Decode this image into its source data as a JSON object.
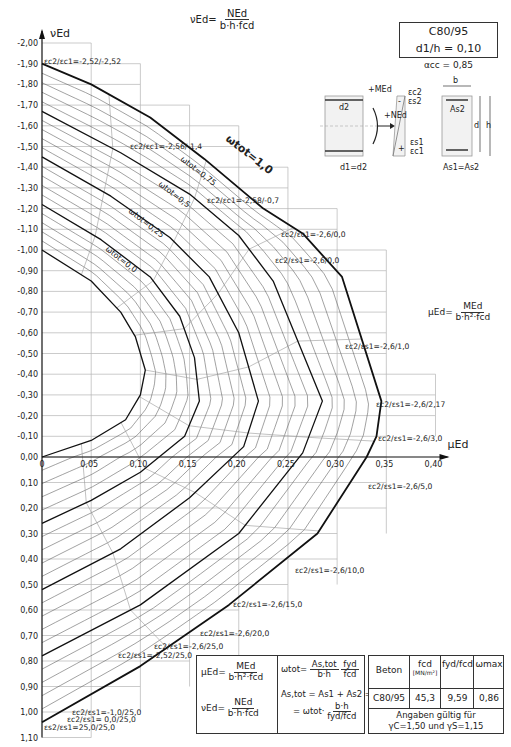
{
  "chart_data": {
    "type": "line",
    "concrete_class": "C80/95",
    "d1_over_h": "d1/h = 0,10",
    "alpha_cc": "αcc = 0,85",
    "xlabel": "μEd",
    "ylabel": "νEd",
    "x_ticks": [
      "0",
      "0,05",
      "0,10",
      "0,15",
      "0,20",
      "0,25",
      "0,30",
      "0,35",
      "0,40"
    ],
    "x_tick_values": [
      0,
      0.05,
      0.1,
      0.15,
      0.2,
      0.25,
      0.3,
      0.35,
      0.4
    ],
    "y_ticks": [
      "-2,00",
      "-1,90",
      "-1,80",
      "-1,70",
      "-1,60",
      "-1,50",
      "-1,40",
      "-1,30",
      "-1,20",
      "-1,10",
      "-1,00",
      "-0,90",
      "-0,80",
      "-0,70",
      "-0,60",
      "-0,50",
      "-0,40",
      "-0,30",
      "-0,20",
      "-0,10",
      "0,00",
      "0,10",
      "0,20",
      "0,30",
      "0,40",
      "0,50",
      "0,60",
      "0,70",
      "0,80",
      "0,90",
      "1,00",
      "1,10"
    ],
    "xlim": [
      0,
      0.4
    ],
    "ylim": [
      -2.0,
      1.1
    ],
    "grid": true,
    "series": [
      {
        "name": "ωtot=0,0",
        "points": [
          [
            0,
            -1.0
          ],
          [
            0.05,
            -0.85
          ],
          [
            0.08,
            -0.7
          ],
          [
            0.095,
            -0.58
          ],
          [
            0.105,
            -0.42
          ],
          [
            0.1,
            -0.3
          ],
          [
            0.085,
            -0.18
          ],
          [
            0.05,
            -0.08
          ],
          [
            0,
            0.0
          ]
        ]
      },
      {
        "name": "ωtot=0,25",
        "points": [
          [
            0,
            -1.22
          ],
          [
            0.06,
            -1.05
          ],
          [
            0.11,
            -0.87
          ],
          [
            0.14,
            -0.68
          ],
          [
            0.155,
            -0.48
          ],
          [
            0.16,
            -0.27
          ],
          [
            0.145,
            -0.1
          ],
          [
            0.1,
            0.06
          ],
          [
            0.05,
            0.17
          ],
          [
            0,
            0.26
          ]
        ]
      },
      {
        "name": "ωtot=0,5",
        "points": [
          [
            0,
            -1.45
          ],
          [
            0.07,
            -1.26
          ],
          [
            0.13,
            -1.06
          ],
          [
            0.17,
            -0.87
          ],
          [
            0.2,
            -0.6
          ],
          [
            0.22,
            -0.27
          ],
          [
            0.205,
            -0.05
          ],
          [
            0.15,
            0.16
          ],
          [
            0.08,
            0.36
          ],
          [
            0,
            0.52
          ]
        ]
      },
      {
        "name": "ωtot=0,75",
        "points": [
          [
            0,
            -1.67
          ],
          [
            0.08,
            -1.47
          ],
          [
            0.15,
            -1.27
          ],
          [
            0.2,
            -1.07
          ],
          [
            0.235,
            -0.85
          ],
          [
            0.285,
            -0.27
          ],
          [
            0.265,
            -0.02
          ],
          [
            0.2,
            0.3
          ],
          [
            0.1,
            0.58
          ],
          [
            0,
            0.78
          ]
        ]
      },
      {
        "name": "ωtot=1,0",
        "points": [
          [
            0,
            -1.9
          ],
          [
            0.05,
            -1.8
          ],
          [
            0.11,
            -1.64
          ],
          [
            0.165,
            -1.44
          ],
          [
            0.225,
            -1.2
          ],
          [
            0.265,
            -1.08
          ],
          [
            0.305,
            -0.87
          ],
          [
            0.345,
            -0.27
          ],
          [
            0.34,
            -0.1
          ],
          [
            0.33,
            0.0
          ],
          [
            0.28,
            0.3
          ],
          [
            0.19,
            0.58
          ],
          [
            0.1,
            0.82
          ],
          [
            0,
            1.04
          ]
        ]
      }
    ],
    "curve_labels": [
      "ωtot=0,0",
      "ωtot=0,25",
      "ωtot=0,5",
      "ωtot=0,75",
      "ωtot=1,0"
    ],
    "strain_annotations": [
      "εc2/εc1=-2,52/-2,52",
      "εc2/εc1=-2,56/-1,4",
      "εc2/εc1=-2,58/-0,7",
      "εc2/εc1=-2,6/0,0",
      "εc2/εs1=-2,6/0,0",
      "εc2/εs1=-2,6/1,0",
      "εc2/εs1=-2,6/2,17",
      "εc2/εs1=-2,6/3,0",
      "εc2/εs1=-2,6/5,0",
      "εc2/εs1=-2,6/10,0",
      "εc2/εs1=-2,6/15,0",
      "εc2/εs1=-2,6/20,0",
      "εc2/εs1=-2,6/25,0",
      "εc2/εs1=-2,52/25,0",
      "εc2/εs1=-1,0/25,0",
      "εc2/εs1= 0,0/25,0",
      "εs2/εs1=25,0/25,0"
    ]
  },
  "header": {
    "concrete_class": "C80/95",
    "ratio": "d1/h = 0,10",
    "alpha": "αcc = 0,85"
  },
  "formulas": {
    "nu_top": {
      "lhs": "νEd=",
      "num": "NEd",
      "den": "b·h·fcd"
    },
    "mu_right": {
      "lhs": "μEd=",
      "num": "MEd",
      "den": "b·h²·fcd"
    }
  },
  "section_sketch": {
    "labels": [
      "d2",
      "+MEd",
      "+NEd",
      "d1=d2",
      "εc2",
      "εs2",
      "εs1",
      "εc1",
      "b",
      "As2",
      "d",
      "h",
      "As1=As2",
      "-",
      "+"
    ]
  },
  "legend_box": {
    "mu": {
      "lhs": "μEd=",
      "num": "MEd",
      "den": "b·h²·fcd"
    },
    "nu": {
      "lhs": "νEd=",
      "num": "NEd",
      "den": "b·h·fcd"
    },
    "omega": {
      "lhs": "ωtot=",
      "num1": "As,tot",
      "den1": "b·h",
      "num2": "fyd",
      "den2": "fcd"
    },
    "as_tot_line": "As,tot = As1 + As2 =",
    "as_tot_rhs": {
      "lhs": "= ωtot·",
      "num": "b·h",
      "den": "fyd/fcd"
    }
  },
  "table": {
    "headers": [
      "Beton",
      "fcd",
      "fyd/fcd",
      "ωmax"
    ],
    "unit": "[MN/m²]",
    "rows": [
      [
        "C80/95",
        "45,3",
        "9,59",
        "0,86"
      ]
    ],
    "footer_line1": "Angaben gültig für",
    "footer_line2": "γC=1,50 und γS=1,15"
  }
}
